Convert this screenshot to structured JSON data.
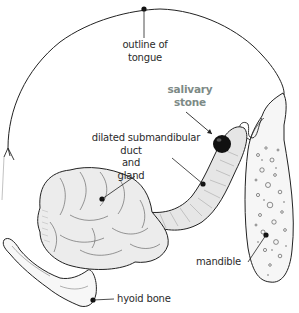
{
  "diagram": {
    "colors": {
      "line": "#222222",
      "emphasis_label": "#7d8a86",
      "gland_fill": "#ececec",
      "bone_fill": "#f7f7f7",
      "stone": "#111111"
    },
    "labels": {
      "tongue": {
        "line1": "outline of",
        "line2": "tongue"
      },
      "stone": {
        "line1": "salivary",
        "line2": "stone"
      },
      "duct": {
        "line1": "dilated submandibular",
        "line2": "duct",
        "line3": "and",
        "line4": "gland"
      },
      "mandible": "mandible",
      "hyoid": "hyoid bone"
    },
    "structures": [
      "tongue-outline",
      "salivary-stone",
      "submandibular-duct",
      "submandibular-gland",
      "mandible",
      "hyoid-bone"
    ]
  }
}
